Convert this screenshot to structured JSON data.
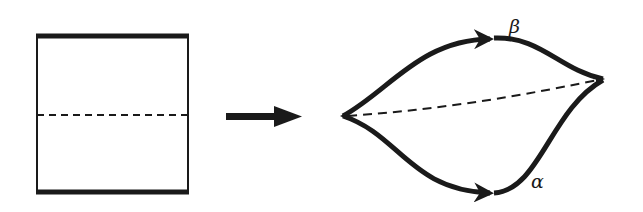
{
  "diagram": {
    "square": {
      "x": 37,
      "y": 37,
      "width": 151,
      "height": 154,
      "thick_edges": [
        "top",
        "bottom"
      ],
      "midline": "dashed"
    },
    "arrow": {
      "from": [
        226,
        116
      ],
      "to": [
        302,
        116
      ]
    },
    "lens": {
      "left_vertex": [
        342,
        116
      ],
      "right_vertex": [
        603,
        79
      ],
      "top_arc_label": "β",
      "bottom_arc_label": "α",
      "inner_curve": "dashed"
    },
    "labels": {
      "beta": "β",
      "alpha": "α"
    },
    "stroke_color": "#1a1a1a"
  }
}
